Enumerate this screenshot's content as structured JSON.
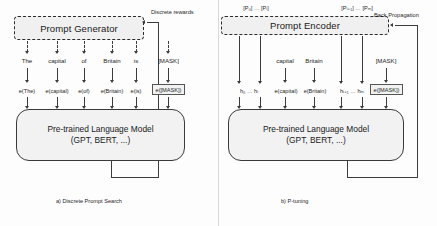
{
  "figure": {
    "panels": [
      {
        "id": "discrete-prompt-search",
        "caption": "a) Discrete Prompt Search",
        "generator_box": "Prompt Generator",
        "feedback_label": "Discrete rewards",
        "model_line1": "Pre-trained Language Model",
        "model_line2": "(GPT, BERT, ...)",
        "tokens": [
          "The",
          "capital",
          "of",
          "Britain",
          "is",
          "[MASK]"
        ],
        "embeddings": [
          "e(The)",
          "e(capital)",
          "e(of)",
          "e(Britain)",
          "e(is)",
          "e([MASK])"
        ],
        "boxed_embedding": "e([MASK])"
      },
      {
        "id": "p-tuning",
        "caption": "b) P-tuning",
        "encoder_box": "Prompt Encoder",
        "feedback_label": "Back Propagation",
        "model_line1": "Pre-trained Language Model",
        "model_line2": "(GPT, BERT, ...)",
        "prompt_label_left": "[P₀] … [Pᵢ]",
        "prompt_label_right": "[Pᵢ₊₁] … [Pₘ]",
        "tokens": [
          "capital",
          "Britain",
          "[MASK]"
        ],
        "hidden_left": "h₀ … hᵢ",
        "hidden_right": "hᵢ₊₁ … hₘ",
        "embeddings": [
          "e(capital)",
          "e(Britain)",
          "e([MASK])"
        ],
        "boxed_embedding": "e([MASK])"
      }
    ]
  },
  "colors": {
    "box_fill": "#f2f2f2",
    "stroke": "#3b3b3b",
    "background": "#fdfdfd"
  }
}
